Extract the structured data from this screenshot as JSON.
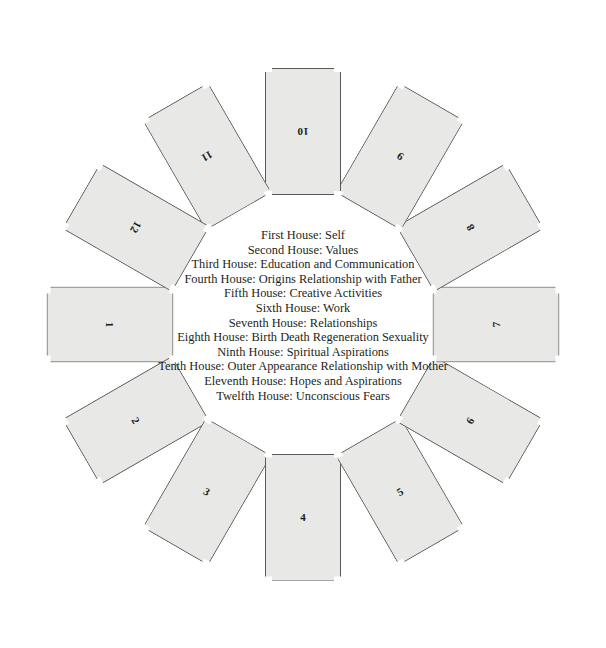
{
  "page": {
    "background_color": "#ffffff",
    "width": 606,
    "height": 648
  },
  "wheel": {
    "center_x": 303,
    "center_y": 324,
    "radius": 193,
    "card_fill": "#e8e8e6",
    "card_border": "#5a5a5a",
    "card_width": 76,
    "card_height": 127,
    "cards": [
      {
        "number": "1",
        "angle_deg": 180,
        "rotation_deg": 90,
        "orientation": "landscape"
      },
      {
        "number": "2",
        "angle_deg": 150,
        "rotation_deg": 60,
        "orientation": "rotated"
      },
      {
        "number": "3",
        "angle_deg": 120,
        "rotation_deg": 30,
        "orientation": "rotated"
      },
      {
        "number": "4",
        "angle_deg": 90,
        "rotation_deg": 0,
        "orientation": "portrait"
      },
      {
        "number": "5",
        "angle_deg": 60,
        "rotation_deg": -30,
        "orientation": "rotated"
      },
      {
        "number": "6",
        "angle_deg": 30,
        "rotation_deg": -60,
        "orientation": "rotated"
      },
      {
        "number": "7",
        "angle_deg": 0,
        "rotation_deg": -90,
        "orientation": "landscape"
      },
      {
        "number": "8",
        "angle_deg": -30,
        "rotation_deg": -120,
        "orientation": "rotated"
      },
      {
        "number": "9",
        "angle_deg": -60,
        "rotation_deg": -150,
        "orientation": "rotated"
      },
      {
        "number": "10",
        "angle_deg": -90,
        "rotation_deg": 180,
        "orientation": "portrait"
      },
      {
        "number": "11",
        "angle_deg": -120,
        "rotation_deg": 150,
        "orientation": "rotated"
      },
      {
        "number": "12",
        "angle_deg": -150,
        "rotation_deg": 120,
        "orientation": "rotated"
      }
    ]
  },
  "legend": {
    "text_color": "#231f20",
    "lines": [
      "First House: Self",
      "Second House: Values",
      "Third House: Education and Communication",
      "Fourth House: Origins Relationship with Father",
      "Fifth House: Creative Activities",
      "Sixth House: Work",
      "Seventh House: Relationships",
      "Eighth House: Birth Death Regeneration Sexuality",
      "Ninth House: Spiritual Aspirations",
      "Tenth House: Outer Appearance Relationship with Mother",
      "Eleventh House: Hopes and Aspirations",
      "Twelfth House: Unconscious Fears"
    ]
  }
}
